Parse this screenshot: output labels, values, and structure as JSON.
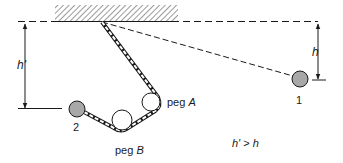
{
  "diagram": {
    "type": "physics-pendulum-pegs",
    "labels": {
      "h": "h",
      "h_prime": "h'",
      "ball_1": "1",
      "ball_2": "2",
      "peg_a_prefix": "peg ",
      "peg_a_letter": "A",
      "peg_b_prefix": "peg ",
      "peg_b_letter": "B",
      "relation_lhs": "h'",
      "relation_op": " > ",
      "relation_rhs": "h"
    },
    "colors": {
      "ink": "#1a1a1a",
      "ball_fill": "#a8a8a8",
      "peg_fill": "#ffffff",
      "hatch": "#555555"
    },
    "elements": {
      "ceiling": {
        "x1": 55,
        "x2": 178,
        "y_top": 5,
        "y_bottom": 22
      },
      "reference_line_y": 22,
      "pivot": {
        "x": 102,
        "y": 22
      },
      "ball_1": {
        "cx": 300,
        "cy": 79,
        "r": 8
      },
      "ball_2": {
        "cx": 77,
        "cy": 109,
        "r": 8
      },
      "peg_a": {
        "cx": 151,
        "cy": 102,
        "r": 9
      },
      "peg_b": {
        "cx": 122,
        "cy": 120,
        "r": 10
      }
    }
  }
}
